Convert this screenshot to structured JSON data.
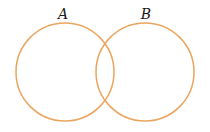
{
  "diagram": {
    "type": "venn",
    "stroke_color": "#EBA55E",
    "sets": [
      {
        "label": "A",
        "cx": 65,
        "cy": 72,
        "r": 49,
        "label_x": 63,
        "label_y": 19
      },
      {
        "label": "B",
        "cx": 145,
        "cy": 72,
        "r": 49,
        "label_x": 146,
        "label_y": 19
      }
    ]
  }
}
